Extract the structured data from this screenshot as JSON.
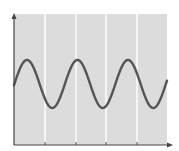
{
  "chart_data": {
    "type": "line",
    "title": "",
    "xlabel": "",
    "ylabel": "",
    "function": "sine",
    "periods": 3.05,
    "phase_start": "near midline rising toward peak",
    "x": [
      0,
      0.5,
      1,
      1.5,
      2,
      2.5,
      3
    ],
    "values": [
      0,
      1,
      0,
      -1,
      0,
      1,
      0
    ],
    "peaks_x_fraction": [
      0.09,
      0.42,
      0.75
    ],
    "troughs_x_fraction": [
      0.25,
      0.58,
      0.92
    ],
    "amplitude_fraction_of_height": 0.18,
    "center_fraction_of_height": 0.45,
    "grid": {
      "vertical": true,
      "horizontal": false,
      "count_vertical": 4
    },
    "axes": {
      "x_arrow": true,
      "y_arrow": true,
      "tick_labels": false
    },
    "legend": null,
    "colors": {
      "plot_background": "#dcdcdc",
      "gridline": "#ffffff",
      "curve": "#555555",
      "axis": "#444444"
    }
  },
  "plot": {
    "left": 14,
    "top": 14,
    "right": 167,
    "bottom": 145,
    "gridlines_x": [
      45,
      76,
      106,
      137
    ],
    "curve": {
      "x_start": 14,
      "x_end": 167,
      "center_y": 84,
      "amplitude": 24,
      "period": 50.5,
      "phase_peak_x": 27
    }
  }
}
